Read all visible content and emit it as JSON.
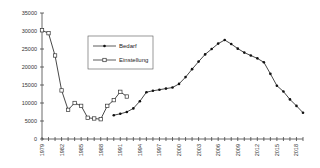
{
  "chart_data": {
    "type": "line",
    "title": "",
    "xlabel": "",
    "ylabel": "",
    "ylim": [
      0,
      35000
    ],
    "xlim": [
      1979,
      2019
    ],
    "grid": false,
    "legend_position": "upper-left-inside",
    "y_ticks": [
      0,
      5000,
      10000,
      15000,
      20000,
      25000,
      30000,
      35000
    ],
    "x_tick_labels": [
      "1979",
      "1982",
      "1985",
      "1988",
      "1991",
      "1994",
      "1997",
      "2000",
      "2003",
      "2006",
      "2009",
      "2012",
      "2015",
      "2018"
    ],
    "series": [
      {
        "name": "Bedarf",
        "marker": "filled-circle",
        "x": [
          1990,
          1991,
          1992,
          1993,
          1994,
          1995,
          1996,
          1997,
          1998,
          1999,
          2000,
          2001,
          2002,
          2003,
          2004,
          2005,
          2006,
          2007,
          2008,
          2009,
          2010,
          2011,
          2012,
          2013,
          2014,
          2015,
          2016,
          2017,
          2018,
          2019
        ],
        "values": [
          6600,
          7000,
          7500,
          8500,
          10500,
          13000,
          13400,
          13700,
          14000,
          14300,
          15300,
          17200,
          19400,
          21500,
          23500,
          25000,
          26500,
          27500,
          26400,
          25100,
          24000,
          23200,
          22400,
          21300,
          18100,
          14800,
          13200,
          11000,
          9200,
          7300
        ]
      },
      {
        "name": "Einstellung",
        "marker": "open-square",
        "x": [
          1979,
          1980,
          1981,
          1982,
          1983,
          1984,
          1985,
          1986,
          1987,
          1988,
          1989,
          1990,
          1991,
          1992
        ],
        "values": [
          30200,
          29400,
          23200,
          13500,
          8100,
          10000,
          9200,
          5900,
          5700,
          5500,
          9200,
          10800,
          13100,
          11800
        ]
      }
    ]
  },
  "legend": {
    "items": [
      {
        "label": "Bedarf"
      },
      {
        "label": "Einstellung"
      }
    ]
  }
}
